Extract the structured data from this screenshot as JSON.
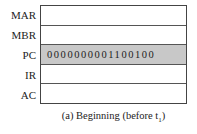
{
  "registers": [
    {
      "name": "MAR",
      "value": "",
      "highlighted": false
    },
    {
      "name": "MBR",
      "value": "",
      "highlighted": false
    },
    {
      "name": "PC",
      "value": "0000000001100100",
      "highlighted": true
    },
    {
      "name": "IR",
      "value": "",
      "highlighted": false
    },
    {
      "name": "AC",
      "value": "",
      "highlighted": false
    }
  ],
  "caption": {
    "text": "(a) Beginning (before t",
    "subscript": "1",
    "close": ")"
  },
  "colors": {
    "highlight": "#c8c8c8",
    "border": "#444444"
  }
}
